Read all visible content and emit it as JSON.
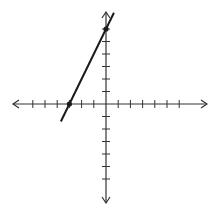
{
  "chart_data": {
    "type": "line",
    "title": "",
    "xlabel": "",
    "ylabel": "",
    "xlim": [
      -7,
      8
    ],
    "ylim": [
      -8,
      7
    ],
    "grid": false,
    "legend": null,
    "x_ticks": [
      -6,
      -5,
      -4,
      -3,
      -2,
      -1,
      1,
      2,
      3,
      4,
      5,
      6
    ],
    "y_ticks": [
      -6,
      -5,
      -4,
      -3,
      -2,
      -1,
      1,
      2,
      3,
      4,
      5,
      6
    ],
    "series": [
      {
        "name": "line",
        "equation": "y = 2x + 6",
        "x": [
          -3.7,
          0.65
        ],
        "y": [
          -1.4,
          7.3
        ],
        "marked_points": [
          [
            -3,
            0
          ],
          [
            0,
            6
          ]
        ]
      }
    ]
  },
  "style": {
    "axis_color": "#333333",
    "line_color": "#1a1a1a",
    "point_color": "#1a1a1a"
  }
}
